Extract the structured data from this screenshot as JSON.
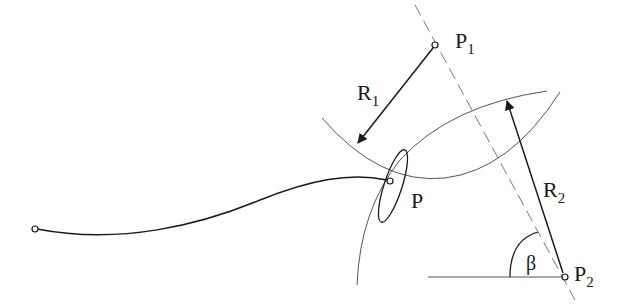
{
  "diagram": {
    "labels": {
      "p1": "P",
      "p1_sub": "1",
      "p2": "P",
      "p2_sub": "2",
      "p": "P",
      "r1": "R",
      "r1_sub": "1",
      "r2": "R",
      "r2_sub": "2",
      "beta": "β"
    },
    "points": {
      "P1": [
        435,
        45
      ],
      "P2": [
        565,
        277
      ],
      "P": [
        390,
        181
      ],
      "start": [
        35,
        229
      ]
    },
    "colors": {
      "stroke": "#1a1a1a",
      "thin": "#555555",
      "dashed": "#777777"
    }
  }
}
